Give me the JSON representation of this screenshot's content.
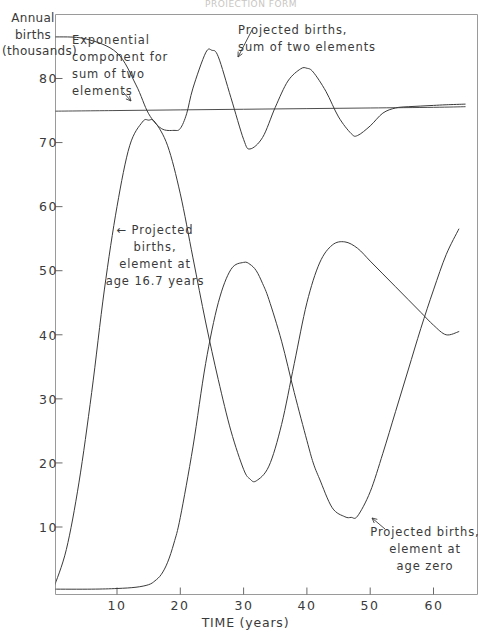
{
  "figure": {
    "top_partial_title": "PROJECTION FORM",
    "background": "#ffffff",
    "line_color": "#3a3a3a"
  },
  "axes": {
    "y_title": "Annual\nbirths\n(thousands)",
    "y_title_lines": [
      "Annual",
      "births",
      "(thousands)"
    ],
    "x_title": "TIME (years)",
    "y_ticks": [
      "10",
      "20",
      "30",
      "40",
      "50",
      "60",
      "70",
      "80"
    ],
    "y_tick_values": [
      10,
      20,
      30,
      40,
      50,
      60,
      70,
      80
    ],
    "x_ticks": [
      "10",
      "20",
      "30",
      "40",
      "50",
      "60"
    ],
    "x_tick_values": [
      10,
      20,
      30,
      40,
      50,
      60
    ]
  },
  "annotations": {
    "exponential": "Exponential\ncomponent for\nsum of two\nelements",
    "sum": "Projected  births,\nsum of  two  elements",
    "age167": "← Projected\nbirths,\nelement at\nage  16.7 years",
    "agezero": "Projected births,\nelement at\nage zero"
  },
  "chart_data": {
    "type": "line",
    "title": "PROJECTION FORM",
    "xlabel": "TIME (years)",
    "ylabel": "Annual births (thousands)",
    "xlim": [
      0,
      65
    ],
    "ylim": [
      0,
      87
    ],
    "grid": false,
    "legend": "annotations-inline",
    "series": [
      {
        "name": "Exponential component for sum of two elements",
        "style": "thin-straight",
        "x": [
          0,
          10,
          20,
          30,
          40,
          50,
          60,
          65
        ],
        "y": [
          74.9,
          75.0,
          75.1,
          75.2,
          75.3,
          75.4,
          75.5,
          75.6
        ]
      },
      {
        "name": "Projected births, sum of two elements",
        "style": "damped-oscillation",
        "x": [
          0,
          5,
          10,
          13,
          15,
          17,
          19,
          20,
          21,
          22,
          24,
          25,
          26,
          28,
          30,
          31,
          33,
          35,
          37,
          39,
          40,
          41,
          43,
          45,
          47,
          48,
          50,
          52,
          54,
          56,
          58,
          60,
          62,
          65
        ],
        "y": [
          86.5,
          86.2,
          84.0,
          79.0,
          74.5,
          72.2,
          71.9,
          72.2,
          74.5,
          78.5,
          84.0,
          84.4,
          83.4,
          77.0,
          70.5,
          69.0,
          70.8,
          75.5,
          79.6,
          81.5,
          81.6,
          81.0,
          78.0,
          74.0,
          71.4,
          71.1,
          72.6,
          74.6,
          75.4,
          75.6,
          75.7,
          75.8,
          75.9,
          76.0
        ]
      },
      {
        "name": "Projected births, element at age 16.7 years",
        "style": "damped-oscillation",
        "x": [
          0,
          2,
          4,
          6,
          8,
          10,
          12,
          14,
          15,
          16,
          18,
          20,
          22,
          24,
          26,
          28,
          30,
          31,
          32,
          34,
          36,
          38,
          40,
          42,
          44,
          46,
          48,
          50,
          52,
          54,
          56,
          58,
          60,
          62,
          64
        ],
        "y": [
          0.5,
          6.5,
          17.0,
          31.0,
          47.0,
          60.0,
          69.5,
          73.2,
          73.5,
          73.2,
          69.5,
          62.0,
          52.0,
          42.0,
          33.0,
          25.0,
          19.0,
          17.5,
          17.2,
          19.5,
          26.0,
          35.5,
          45.0,
          51.2,
          54.0,
          54.5,
          53.5,
          51.5,
          49.5,
          47.5,
          45.5,
          43.5,
          41.5,
          40.0,
          40.5
        ]
      },
      {
        "name": "Projected births, element at age zero",
        "style": "damped-oscillation",
        "x": [
          0,
          6,
          10,
          13,
          15,
          16,
          17,
          18,
          19,
          20,
          22,
          24,
          26,
          28,
          30,
          31,
          32,
          33,
          34,
          36,
          38,
          40,
          41,
          42,
          44,
          46,
          47,
          48,
          50,
          52,
          54,
          56,
          58,
          60,
          62,
          64
        ],
        "y": [
          0.3,
          0.3,
          0.4,
          0.6,
          1.0,
          1.6,
          2.6,
          4.5,
          7.5,
          11.5,
          22.5,
          35.5,
          45.0,
          50.2,
          51.3,
          51.0,
          50.0,
          48.0,
          45.5,
          39.0,
          31.0,
          23.5,
          20.0,
          17.5,
          13.0,
          11.6,
          11.5,
          11.7,
          15.5,
          21.5,
          28.0,
          34.5,
          41.0,
          47.0,
          52.5,
          56.5
        ]
      }
    ]
  }
}
